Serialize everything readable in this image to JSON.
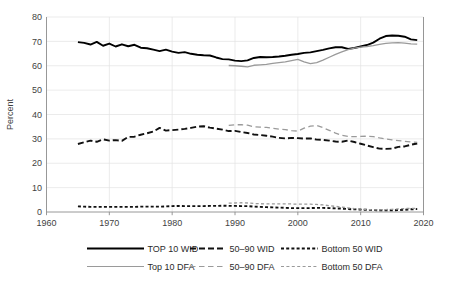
{
  "chart_data": {
    "type": "line",
    "title": "",
    "xlabel": "",
    "ylabel": "Percent",
    "xlim": [
      1960,
      2020
    ],
    "ylim": [
      0,
      80
    ],
    "xticks": [
      1960,
      1970,
      1980,
      1990,
      2000,
      2010,
      2020
    ],
    "yticks": [
      0,
      10,
      20,
      30,
      40,
      50,
      60,
      70,
      80
    ],
    "grid": true,
    "legend_position": "bottom",
    "series": [
      {
        "name": "TOP 10 WID",
        "color": "#000000",
        "style": "solid",
        "width": 1.9,
        "x": [
          1965,
          1966,
          1967,
          1968,
          1969,
          1970,
          1971,
          1972,
          1973,
          1974,
          1975,
          1976,
          1977,
          1978,
          1979,
          1980,
          1981,
          1982,
          1983,
          1984,
          1985,
          1986,
          1987,
          1988,
          1989,
          1990,
          1991,
          1992,
          1993,
          1994,
          1995,
          1996,
          1997,
          1998,
          1999,
          2000,
          2001,
          2002,
          2003,
          2004,
          2005,
          2006,
          2007,
          2008,
          2009,
          2010,
          2011,
          2012,
          2013,
          2014,
          2015,
          2016,
          2017,
          2018,
          2019
        ],
        "values": [
          69.7,
          69.4,
          68.7,
          69.8,
          68.2,
          69.1,
          67.9,
          68.8,
          68.0,
          68.6,
          67.4,
          67.2,
          66.6,
          66.0,
          66.6,
          65.8,
          65.3,
          65.6,
          64.9,
          64.5,
          64.3,
          64.2,
          63.4,
          62.7,
          62.6,
          62.1,
          61.9,
          62.2,
          63.2,
          63.6,
          63.5,
          63.6,
          63.8,
          64.1,
          64.5,
          64.8,
          65.3,
          65.5,
          66.0,
          66.5,
          67.1,
          67.6,
          67.6,
          66.9,
          67.3,
          67.9,
          68.5,
          69.5,
          71.1,
          72.2,
          72.4,
          72.3,
          71.9,
          70.8,
          70.5
        ]
      },
      {
        "name": "50–90 WID",
        "color": "#111111",
        "style": "dashed",
        "width": 1.9,
        "dasharray": "6,3",
        "x": [
          1965,
          1966,
          1967,
          1968,
          1969,
          1970,
          1971,
          1972,
          1973,
          1974,
          1975,
          1976,
          1977,
          1978,
          1979,
          1980,
          1981,
          1982,
          1983,
          1984,
          1985,
          1986,
          1987,
          1988,
          1989,
          1990,
          1991,
          1992,
          1993,
          1994,
          1995,
          1996,
          1997,
          1998,
          1999,
          2000,
          2001,
          2002,
          2003,
          2004,
          2005,
          2006,
          2007,
          2008,
          2009,
          2010,
          2011,
          2012,
          2013,
          2014,
          2015,
          2016,
          2017,
          2018,
          2019
        ],
        "values": [
          27.9,
          28.6,
          29.3,
          28.8,
          29.8,
          29.3,
          29.5,
          29.2,
          30.8,
          30.9,
          31.7,
          32.3,
          33.0,
          34.5,
          33.4,
          33.6,
          33.8,
          34.1,
          34.5,
          35.0,
          35.2,
          34.6,
          34.2,
          33.8,
          33.2,
          33.3,
          32.8,
          32.4,
          31.8,
          31.6,
          31.3,
          30.9,
          30.4,
          30.2,
          30.4,
          30.3,
          30.1,
          30.2,
          29.7,
          29.6,
          29.3,
          28.9,
          28.8,
          29.3,
          28.7,
          28.0,
          27.3,
          26.6,
          26.0,
          25.9,
          26.0,
          26.7,
          26.9,
          27.6,
          28.1
        ]
      },
      {
        "name": "Bottom 50 WID",
        "color": "#111111",
        "style": "dotted",
        "width": 1.9,
        "dasharray": "3,2.2",
        "x": [
          1965,
          1966,
          1967,
          1968,
          1969,
          1970,
          1971,
          1972,
          1973,
          1974,
          1975,
          1976,
          1977,
          1978,
          1979,
          1980,
          1981,
          1982,
          1983,
          1984,
          1985,
          1986,
          1987,
          1988,
          1989,
          1990,
          1991,
          1992,
          1993,
          1994,
          1995,
          1996,
          1997,
          1998,
          1999,
          2000,
          2001,
          2002,
          2003,
          2004,
          2005,
          2006,
          2007,
          2008,
          2009,
          2010,
          2011,
          2012,
          2013,
          2014,
          2015,
          2016,
          2017,
          2018,
          2019
        ],
        "values": [
          2.3,
          2.2,
          2.1,
          2.1,
          2.1,
          2.1,
          2.1,
          2.1,
          2.1,
          2.1,
          2.2,
          2.2,
          2.2,
          2.2,
          2.3,
          2.4,
          2.5,
          2.4,
          2.4,
          2.4,
          2.4,
          2.5,
          2.5,
          2.6,
          2.5,
          2.5,
          2.4,
          2.4,
          2.2,
          2.1,
          2.0,
          1.9,
          1.8,
          1.7,
          1.6,
          1.6,
          1.6,
          1.6,
          1.7,
          1.7,
          1.6,
          1.5,
          1.4,
          1.2,
          1.1,
          1.0,
          0.9,
          0.8,
          0.7,
          0.7,
          0.7,
          0.8,
          0.9,
          1.1,
          1.2
        ]
      },
      {
        "name": "Top 10 DFA",
        "color": "#9a9a9a",
        "style": "solid",
        "width": 1.3,
        "x": [
          1989,
          1990,
          1991,
          1992,
          1993,
          1994,
          1995,
          1996,
          1997,
          1998,
          1999,
          2000,
          2001,
          2002,
          2003,
          2004,
          2005,
          2006,
          2007,
          2008,
          2009,
          2010,
          2011,
          2012,
          2013,
          2014,
          2015,
          2016,
          2017,
          2018,
          2019
        ],
        "values": [
          60.1,
          60.0,
          59.8,
          59.5,
          60.2,
          60.4,
          60.6,
          61.0,
          61.3,
          61.6,
          62.1,
          62.6,
          61.6,
          60.9,
          61.3,
          62.3,
          63.5,
          64.7,
          65.7,
          66.6,
          67.2,
          67.6,
          67.9,
          68.3,
          68.8,
          69.2,
          69.4,
          69.5,
          69.3,
          69.0,
          68.9
        ]
      },
      {
        "name": "50–90 DFA",
        "color": "#9a9a9a",
        "style": "dashed",
        "width": 1.3,
        "dasharray": "5.5,3.5",
        "x": [
          1989,
          1990,
          1991,
          1992,
          1993,
          1994,
          1995,
          1996,
          1997,
          1998,
          1999,
          2000,
          2001,
          2002,
          2003,
          2004,
          2005,
          2006,
          2007,
          2008,
          2009,
          2010,
          2011,
          2012,
          2013,
          2014,
          2015,
          2016,
          2017,
          2018,
          2019
        ],
        "values": [
          35.5,
          35.8,
          35.8,
          35.6,
          35.0,
          34.8,
          34.7,
          34.3,
          34.0,
          33.8,
          33.4,
          33.2,
          34.4,
          35.2,
          35.5,
          34.6,
          33.5,
          32.4,
          31.5,
          31.0,
          30.9,
          31.0,
          31.1,
          30.9,
          30.4,
          30.0,
          29.6,
          29.3,
          29.0,
          28.7,
          28.6
        ]
      },
      {
        "name": "Bottom 50 DFA",
        "color": "#9a9a9a",
        "style": "dotted",
        "width": 1.3,
        "dasharray": "3,2.4",
        "x": [
          1989,
          1990,
          1991,
          1992,
          1993,
          1994,
          1995,
          1996,
          1997,
          1998,
          1999,
          2000,
          2001,
          2002,
          2003,
          2004,
          2005,
          2006,
          2007,
          2008,
          2009,
          2010,
          2011,
          2012,
          2013,
          2014,
          2015,
          2016,
          2017,
          2018,
          2019
        ],
        "values": [
          3.6,
          3.7,
          3.8,
          3.7,
          3.5,
          3.4,
          3.3,
          3.3,
          3.3,
          3.3,
          3.3,
          3.2,
          3.2,
          3.2,
          3.1,
          2.9,
          2.6,
          2.3,
          2.0,
          1.7,
          1.4,
          1.2,
          1.0,
          0.9,
          0.9,
          1.0,
          1.1,
          1.3,
          1.4,
          1.5,
          1.5
        ]
      }
    ]
  },
  "axis": {
    "ylabel": "Percent",
    "ytick_labels": [
      "0",
      "10",
      "20",
      "30",
      "40",
      "50",
      "60",
      "70",
      "80"
    ],
    "xtick_labels": [
      "1960",
      "1970",
      "1980",
      "1990",
      "2000",
      "2010",
      "2020"
    ]
  },
  "legend": {
    "rows": [
      [
        {
          "label": "TOP 10 WID",
          "color": "#000000",
          "style": "solid",
          "width": 2.2
        },
        {
          "label": "50–90 WID",
          "color": "#111111",
          "style": "dashed",
          "width": 2.2,
          "dasharray": "6,3"
        },
        {
          "label": "Bottom 50 WID",
          "color": "#111111",
          "style": "dotted",
          "width": 2.2,
          "dasharray": "3,2.2"
        }
      ],
      [
        {
          "label": "Top 10 DFA",
          "color": "#9a9a9a",
          "style": "solid",
          "width": 1.2
        },
        {
          "label": "50–90 DFA",
          "color": "#9a9a9a",
          "style": "dashed",
          "width": 1.2,
          "dasharray": "5.5,3.5"
        },
        {
          "label": "Bottom 50 DFA",
          "color": "#9a9a9a",
          "style": "dotted",
          "width": 1.2,
          "dasharray": "3,2.4"
        }
      ]
    ]
  },
  "colors": {
    "wid": "#000000",
    "dfa": "#9a9a9a",
    "grid": "#e2e2e2",
    "axis": "#8c8c8c",
    "text": "#3f3f3f",
    "background": "#ffffff"
  }
}
